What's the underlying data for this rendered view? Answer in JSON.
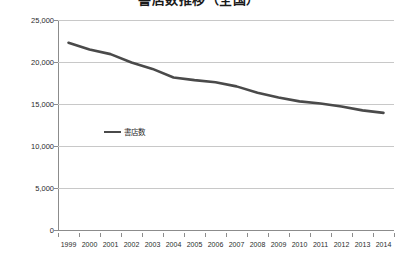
{
  "chart_data": {
    "type": "line",
    "title": "書店数推移（全国）",
    "xlabel": "",
    "ylabel": "",
    "x": [
      1999,
      2000,
      2001,
      2002,
      2003,
      2004,
      2005,
      2006,
      2007,
      2008,
      2009,
      2010,
      2011,
      2012,
      2013,
      2014
    ],
    "categories": [
      "1999",
      "2000",
      "2001",
      "2002",
      "2003",
      "2004",
      "2005",
      "2006",
      "2007",
      "2008",
      "2009",
      "2010",
      "2011",
      "2012",
      "2013",
      "2014"
    ],
    "series": [
      {
        "name": "書店数",
        "color": "#4a4a4a",
        "values": [
          22296,
          21495,
          20939,
          19946,
          19179,
          18156,
          17839,
          17582,
          17098,
          16342,
          15765,
          15314,
          15061,
          14696,
          14241,
          13943
        ]
      }
    ],
    "ylim": [
      0,
      25000
    ],
    "yticks": [
      0,
      5000,
      10000,
      15000,
      20000,
      25000
    ],
    "ytick_labels": [
      "0",
      "5,000",
      "10,000",
      "15,000",
      "20,000",
      "25,000"
    ],
    "grid": true,
    "grid_axis": "y",
    "legend": {
      "position": "inside-left",
      "entries": [
        "書店数"
      ]
    }
  }
}
